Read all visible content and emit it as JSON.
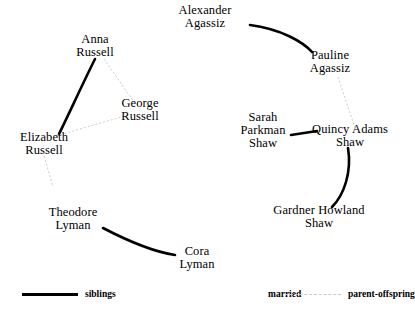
{
  "diagram": {
    "type": "genealogy-network",
    "nodes": [
      {
        "id": "alexander_agassiz",
        "lines": [
          "Alexander",
          "Agassiz"
        ],
        "x": 205,
        "y": 17
      },
      {
        "id": "pauline_agassiz",
        "lines": [
          "Pauline",
          "Agassiz"
        ],
        "x": 330,
        "y": 62
      },
      {
        "id": "anna_russell",
        "lines": [
          "Anna",
          "Russell"
        ],
        "x": 95,
        "y": 46
      },
      {
        "id": "george_russell",
        "lines": [
          "George",
          "Russell"
        ],
        "x": 140,
        "y": 110
      },
      {
        "id": "elizabeth_russell",
        "lines": [
          "Elizabeth",
          "Russell"
        ],
        "x": 44,
        "y": 144
      },
      {
        "id": "sarah_parkman_shaw",
        "lines": [
          "Sarah",
          "Parkman",
          "Shaw"
        ],
        "x": 263,
        "y": 131
      },
      {
        "id": "quincy_adams_shaw",
        "lines": [
          "Quincy  Adams",
          "Shaw"
        ],
        "x": 350,
        "y": 136
      },
      {
        "id": "gardner_howland_shaw",
        "lines": [
          "Gardner  Howland",
          "Shaw"
        ],
        "x": 319,
        "y": 217
      },
      {
        "id": "theodore_lyman",
        "lines": [
          "Theodore",
          "Lyman"
        ],
        "x": 73,
        "y": 219
      },
      {
        "id": "cora_lyman",
        "lines": [
          "Cora",
          "Lyman"
        ],
        "x": 197,
        "y": 258
      }
    ],
    "edges": [
      {
        "id": "e_alexander_pauline",
        "from": "alexander_agassiz",
        "to": "pauline_agassiz",
        "relation": "siblings",
        "path": "M 250 25 C 281 29 303 42 312 52"
      },
      {
        "id": "e_anna_elizabeth",
        "from": "anna_russell",
        "to": "elizabeth_russell",
        "relation": "siblings",
        "path": "M 95 59 C 82 85 68 116 59 134"
      },
      {
        "id": "e_anna_george",
        "from": "anna_russell",
        "to": "george_russell",
        "relation": "parent-offspring",
        "path": "M 104 59 L 134 102"
      },
      {
        "id": "e_george_elizabeth",
        "from": "george_russell",
        "to": "elizabeth_russell",
        "relation": "parent-offspring",
        "path": "M 128 115 L 56 136"
      },
      {
        "id": "e_elizabeth_theodore",
        "from": "elizabeth_russell",
        "to": "theodore_lyman",
        "relation": "parent-offspring",
        "path": "M 44 156 L 53 187"
      },
      {
        "id": "e_theodore_cora",
        "from": "theodore_lyman",
        "to": "cora_lyman",
        "relation": "siblings",
        "path": "M 103 228 C 128 241 155 252 175 255"
      },
      {
        "id": "e_pauline_quincy",
        "from": "pauline_agassiz",
        "to": "quincy_adams_shaw",
        "relation": "parent-offspring",
        "path": "M 338 77 L 355 128"
      },
      {
        "id": "e_sarah_quincy",
        "from": "sarah_parkman_shaw",
        "to": "quincy_adams_shaw",
        "relation": "siblings",
        "path": "M 291 135 L 317 131"
      },
      {
        "id": "e_quincy_gardner",
        "from": "quincy_adams_shaw",
        "to": "gardner_howland_shaw",
        "relation": "siblings",
        "path": "M 348 148 C 352 172 344 195 332 207"
      }
    ]
  },
  "legend": {
    "entries": [
      {
        "id": "siblings",
        "label": "siblings",
        "style": "solid-thick",
        "color": "#000000",
        "x": 22
      },
      {
        "id": "married",
        "label": "married",
        "style": "invisible",
        "color": "#ffffff",
        "x": 205
      },
      {
        "id": "parent_offspring",
        "label": "parent-offspring",
        "style": "dotted-thin",
        "color": "#c9c9c9",
        "x": 285
      }
    ]
  }
}
